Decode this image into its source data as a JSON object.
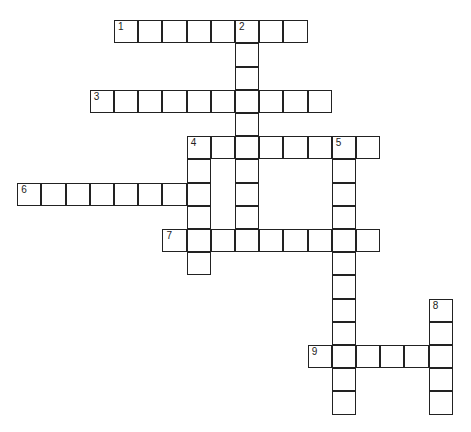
{
  "puzzle": {
    "type": "crossword",
    "origin": {
      "x": 18,
      "y": 21
    },
    "cell_w": 24.2,
    "cell_h": 23.2,
    "border_color": "#222222",
    "words": [
      {
        "number": "1",
        "direction": "across",
        "row": 0,
        "col": 4,
        "length": 8
      },
      {
        "number": "2",
        "direction": "down",
        "row": 0,
        "col": 9,
        "length": 10
      },
      {
        "number": "3",
        "direction": "across",
        "row": 3,
        "col": 3,
        "length": 10
      },
      {
        "number": "4",
        "direction": "across",
        "row": 5,
        "col": 7,
        "length": 8
      },
      {
        "number": "4",
        "direction": "down",
        "row": 5,
        "col": 7,
        "length": 6
      },
      {
        "number": "5",
        "direction": "down",
        "row": 5,
        "col": 13,
        "length": 12
      },
      {
        "number": "6",
        "direction": "across",
        "row": 7,
        "col": 0,
        "length": 8
      },
      {
        "number": "7",
        "direction": "across",
        "row": 9,
        "col": 6,
        "length": 9
      },
      {
        "number": "8",
        "direction": "down",
        "row": 12,
        "col": 17,
        "length": 5
      },
      {
        "number": "9",
        "direction": "across",
        "row": 14,
        "col": 12,
        "length": 6
      }
    ]
  }
}
